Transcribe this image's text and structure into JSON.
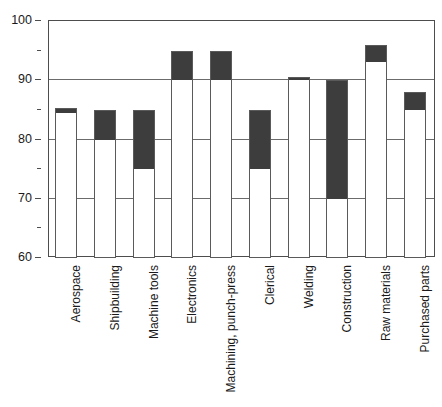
{
  "chart_data": {
    "type": "bar",
    "title": "",
    "subtitle": "",
    "xlabel": "",
    "ylabel": "",
    "ylim": [
      60,
      100
    ],
    "y_major_ticks": [
      60,
      70,
      80,
      90,
      100
    ],
    "y_minor_ticks": [
      65,
      75,
      85,
      95
    ],
    "y_tick_labels": [
      "60",
      "70",
      "80",
      "90",
      "100"
    ],
    "grid": "horizontal-major",
    "legend": "none",
    "baseline": 60,
    "bar_style": "floating-range-bar",
    "series": [
      {
        "name": "range-low",
        "values": [
          84.5,
          80,
          75,
          90,
          90,
          75,
          90,
          70,
          93,
          85
        ]
      },
      {
        "name": "range-high",
        "values": [
          85.3,
          85,
          85,
          95,
          95,
          85,
          90.5,
          90,
          96,
          88
        ]
      }
    ],
    "categories": [
      "Aerospace",
      "Shipbuilding",
      "Machine tools",
      "Electronics",
      "Machining, punch-press",
      "Clerical",
      "Welding",
      "Construction",
      "Raw materials",
      "Purchased parts"
    ],
    "colors": {
      "bar_fill_light": "#ffffff",
      "bar_fill_dark": "#3d3d3d",
      "bar_outline": "#5a5a5a",
      "gridline": "#6b6b6b",
      "axis": "#4d4d4d",
      "text": "#1a1a1a",
      "background": "#ffffff"
    }
  }
}
